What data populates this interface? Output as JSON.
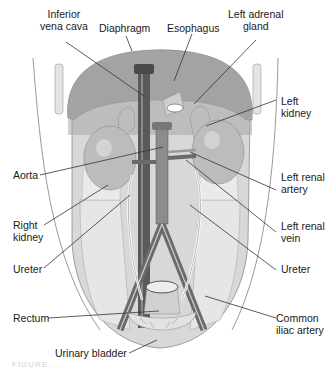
{
  "diagram": {
    "style": "grayscale medical illustration",
    "colors": {
      "background": "#ffffff",
      "diaphragm": "#9a9a9a",
      "body_fill": "#d4d4d4",
      "kidney": "#b8b8b8",
      "vessel_dark": "#5a5a5a",
      "vessel_light": "#e8e8e8",
      "text": "#1a1a1a",
      "leader": "#333333"
    },
    "labels": {
      "inferior_vena_cava": {
        "line1": "Inferior",
        "line2": "vena cava"
      },
      "diaphragm": "Diaphragm",
      "esophagus": "Esophagus",
      "left_adrenal_gland": {
        "line1": "Left adrenal",
        "line2": "gland"
      },
      "left_kidney": {
        "line1": "Left",
        "line2": "kidney"
      },
      "aorta": "Aorta",
      "left_renal_artery": {
        "line1": "Left renal",
        "line2": "artery"
      },
      "right_kidney": {
        "line1": "Right",
        "line2": "kidney"
      },
      "left_renal_vein": {
        "line1": "Left renal",
        "line2": "vein"
      },
      "ureter_left_side": "Ureter",
      "ureter_right_side": "Ureter",
      "rectum": "Rectum",
      "common_iliac_artery": {
        "line1": "Common",
        "line2": "iliac artery"
      },
      "urinary_bladder": "Urinary bladder"
    },
    "caption": "FIGURE ..."
  }
}
